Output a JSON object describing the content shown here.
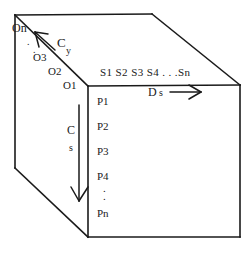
{
  "diagram": {
    "stroke_color": "#1a1a1a",
    "background_color": "#ffffff",
    "axes": {
      "depth": {
        "name_main": "C",
        "name_sub": "y",
        "ticks": [
          "O1",
          "O2",
          "O3",
          "On"
        ],
        "ellipsis": "."
      },
      "horizontal": {
        "name_main": "D",
        "name_sub": "s",
        "ticks_text": "S1  S2  S3  S4 . . .Sn",
        "ticks": [
          "S1",
          "S2",
          "S3",
          "S4",
          "Sn"
        ]
      },
      "vertical": {
        "name_main": "C",
        "name_sub": "s",
        "ticks": [
          "P1",
          "P2",
          "P3",
          "P4",
          "Pn"
        ],
        "ellipsis": "."
      }
    }
  }
}
